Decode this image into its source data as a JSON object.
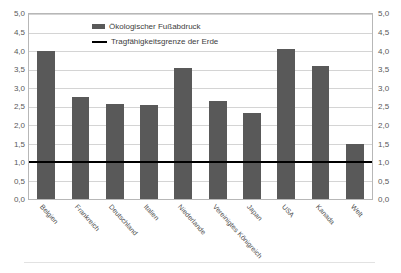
{
  "chart_data": {
    "type": "bar",
    "title": "",
    "xlabel": "",
    "ylabel": "",
    "ylim": [
      0.0,
      5.0
    ],
    "ytick_step": 0.5,
    "grid": true,
    "decimal_separator": ",",
    "legend_position": "top-center-inside",
    "dual_y_axis": true,
    "categories": [
      "Belgien",
      "Frankreich",
      "Deutschland",
      "Italien",
      "Niederlande",
      "Vereinigtes Königreich",
      "Japan",
      "USA",
      "Kanada",
      "Welt"
    ],
    "series": [
      {
        "name": "Ökologischer Fußabdruck",
        "type": "bar",
        "color": "#595959",
        "values": [
          4.0,
          2.75,
          2.57,
          2.54,
          3.55,
          2.64,
          2.33,
          4.05,
          3.6,
          1.5
        ]
      },
      {
        "name": "Tragfähigkeitsgrenze der Erde",
        "type": "threshold-line",
        "color": "#000000",
        "value": 1.0
      }
    ],
    "ytick_labels": [
      "0,0",
      "0,5",
      "1,0",
      "1,5",
      "2,0",
      "2,5",
      "3,0",
      "3,5",
      "4,0",
      "4,5",
      "5,0"
    ],
    "ytick_values": [
      0.0,
      0.5,
      1.0,
      1.5,
      2.0,
      2.5,
      3.0,
      3.5,
      4.0,
      4.5,
      5.0
    ]
  },
  "legend": {
    "items": [
      {
        "label": "Ökologischer Fußabdruck",
        "marker": "bar-swatch"
      },
      {
        "label": "Tragfähigkeitsgrenze der Erde",
        "marker": "line-swatch"
      }
    ]
  },
  "colors": {
    "bar": "#595959",
    "threshold": "#000000",
    "grid": "#d4d4d4",
    "frame": "#b7b7b7",
    "tick_text": "#595959",
    "label_text": "#4d4d4d"
  }
}
